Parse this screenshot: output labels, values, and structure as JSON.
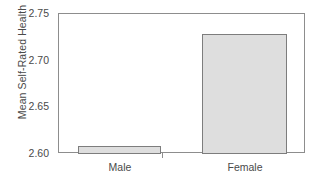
{
  "chart_data": {
    "type": "bar",
    "title": "",
    "subtitle": "",
    "xlabel": "",
    "ylabel": "Mean Self-Rated Health",
    "categories": [
      "Male",
      "Female"
    ],
    "values": [
      2.607,
      2.728
    ],
    "series": [
      {
        "name": "Mean Self-Rated Health",
        "values": [
          2.607,
          2.728
        ]
      }
    ],
    "ylim": [
      2.6,
      2.75
    ],
    "yticks": [
      2.6,
      2.65,
      2.7,
      2.75
    ],
    "ytick_labels": [
      "2.60",
      "2.65",
      "2.70",
      "2.75"
    ],
    "grid": false,
    "legend": false,
    "legend_position": "none",
    "bar_fill_color": "#dedede",
    "bar_edge_color": "#7d7d7d",
    "axis_color": "#8d8d8d",
    "text_color": "#4a4a4a",
    "background_color": "#ffffff",
    "annotations": []
  }
}
